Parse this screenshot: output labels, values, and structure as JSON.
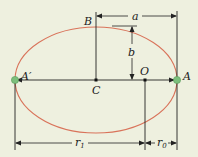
{
  "diagram": {
    "colors": {
      "background": "#eef0df",
      "ellipse": "#d9735a",
      "lines": "#222222",
      "endpoint_dots": "#7cbf7c"
    },
    "ellipse": {
      "cx": 96,
      "cy": 80,
      "rx": 81,
      "ry": 53
    },
    "labels": {
      "A_prime": "A′",
      "A": "A",
      "B": "B",
      "C": "C",
      "O": "O",
      "a": "a",
      "b": "b",
      "r1_main": "r",
      "r1_sub": "1",
      "r0_main": "r",
      "r0_sub": "0"
    }
  }
}
